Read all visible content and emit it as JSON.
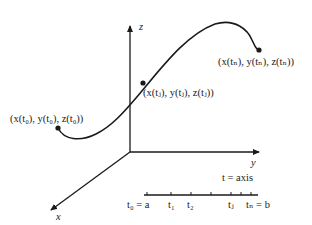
{
  "axes": {
    "z_label": "z",
    "y_label": "y",
    "x_label": "x"
  },
  "points": {
    "start": {
      "label": "(x(t₀), y(t₀), z(t₀))"
    },
    "middle": {
      "label": "(x(tⱼ), y(tⱼ), z(tⱼ))"
    },
    "end": {
      "label": "(x(tₙ), y(tₙ), z(tₙ))"
    }
  },
  "t_axis": {
    "title": "t = axis",
    "ticks": [
      {
        "label": "t₀ = a"
      },
      {
        "label": "t₁"
      },
      {
        "label": "t₂"
      },
      {
        "label": ""
      },
      {
        "label": "tⱼ"
      },
      {
        "label": ""
      },
      {
        "label": "tₙ = b"
      }
    ]
  },
  "colors": {
    "stroke": "#1a1a1a",
    "text": "#222222",
    "background": "#ffffff"
  }
}
